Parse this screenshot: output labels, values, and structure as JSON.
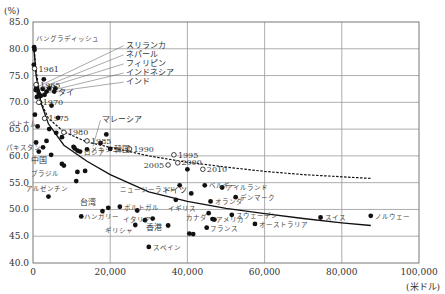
{
  "chart_data": {
    "type": "scatter",
    "title": "",
    "ylabel": "(%)",
    "xlabel": "(米ドル)",
    "xlim": [
      0,
      100000
    ],
    "ylim": [
      40,
      85
    ],
    "x_ticks": [
      0,
      20000,
      40000,
      60000,
      80000,
      100000
    ],
    "x_tick_labels": [
      "0",
      "20,000",
      "40,000",
      "60,000",
      "80,000",
      "100,000"
    ],
    "y_ticks": [
      40,
      45,
      50,
      55,
      60,
      65,
      70,
      75,
      80,
      85
    ],
    "y_tick_labels": [
      "40.0",
      "45.0",
      "50.0",
      "55.0",
      "60.0",
      "65.0",
      "70.0",
      "75.0",
      "80.0",
      "85.0"
    ],
    "grid": true,
    "series": [
      {
        "name": "countries",
        "marker": "filled-circle",
        "points": [
          {
            "x": 300,
            "y": 80.3,
            "label": "バングラディッシュ"
          },
          {
            "x": 400,
            "y": 79.8,
            "label": ""
          },
          {
            "x": 200,
            "y": 77.0,
            "label": ""
          },
          {
            "x": 900,
            "y": 72.8,
            "label": "スリランカ"
          },
          {
            "x": 700,
            "y": 72.3,
            "label": "ネパール"
          },
          {
            "x": 2500,
            "y": 72.5,
            "label": "フィリピン"
          },
          {
            "x": 3500,
            "y": 72.0,
            "label": "インドネシア"
          },
          {
            "x": 1500,
            "y": 71.6,
            "label": "インド"
          },
          {
            "x": 5500,
            "y": 72.0,
            "label": "タイ"
          },
          {
            "x": 2000,
            "y": 71.2,
            "label": ""
          },
          {
            "x": 4200,
            "y": 72.6,
            "label": ""
          },
          {
            "x": 1200,
            "y": 72.2,
            "label": ""
          },
          {
            "x": 5800,
            "y": 72.6,
            "label": ""
          },
          {
            "x": 3000,
            "y": 71.4,
            "label": ""
          },
          {
            "x": 1000,
            "y": 71.0,
            "label": ""
          },
          {
            "x": 2800,
            "y": 74.3,
            "label": ""
          },
          {
            "x": 1800,
            "y": 70.0,
            "label": ""
          },
          {
            "x": 4800,
            "y": 69.4,
            "label": ""
          },
          {
            "x": 6500,
            "y": 67.1,
            "label": ""
          },
          {
            "x": 500,
            "y": 67.7,
            "label": ""
          },
          {
            "x": 1200,
            "y": 65.5,
            "label": "ベトナム"
          },
          {
            "x": 4200,
            "y": 65.0,
            "label": ""
          },
          {
            "x": 800,
            "y": 62.5,
            "label": ""
          },
          {
            "x": 3500,
            "y": 62.8,
            "label": ""
          },
          {
            "x": 2600,
            "y": 61.6,
            "label": "パキスタン"
          },
          {
            "x": 6000,
            "y": 64.3,
            "label": ""
          },
          {
            "x": 7500,
            "y": 63.5,
            "label": ""
          },
          {
            "x": 1500,
            "y": 60.8,
            "label": ""
          },
          {
            "x": 4700,
            "y": 60.2,
            "label": "中国"
          },
          {
            "x": 10500,
            "y": 61.7,
            "label": ""
          },
          {
            "x": 10800,
            "y": 61.4,
            "label": ""
          },
          {
            "x": 11500,
            "y": 61.0,
            "label": ""
          },
          {
            "x": 12200,
            "y": 60.8,
            "label": "ロシア"
          },
          {
            "x": 14000,
            "y": 61.2,
            "label": "メキシコ"
          },
          {
            "x": 7500,
            "y": 58.5,
            "label": ""
          },
          {
            "x": 8000,
            "y": 58.2,
            "label": "ブラジル"
          },
          {
            "x": 11500,
            "y": 57.0,
            "label": ""
          },
          {
            "x": 13500,
            "y": 57.2,
            "label": ""
          },
          {
            "x": 11200,
            "y": 55.3,
            "label": "アルゼンチン"
          },
          {
            "x": 19000,
            "y": 64.0,
            "label": ""
          },
          {
            "x": 17500,
            "y": 62.4,
            "label": ""
          },
          {
            "x": 20000,
            "y": 61.3,
            "label": "韓国"
          },
          {
            "x": 4000,
            "y": 52.4,
            "label": ""
          },
          {
            "x": 12500,
            "y": 48.7,
            "label": "ハンガリー"
          },
          {
            "x": 18000,
            "y": 49.7,
            "label": "台湾"
          },
          {
            "x": 19500,
            "y": 50.3,
            "label": ""
          },
          {
            "x": 22500,
            "y": 50.5,
            "label": "ポルトガル"
          },
          {
            "x": 26500,
            "y": 47.1,
            "label": "ギリシャ"
          },
          {
            "x": 30000,
            "y": 43.0,
            "label": "スペイン"
          },
          {
            "x": 27000,
            "y": 49.8,
            "label": ""
          },
          {
            "x": 29000,
            "y": 48.0,
            "label": ""
          },
          {
            "x": 31000,
            "y": 48.3,
            "label": "イタリア"
          },
          {
            "x": 35000,
            "y": 47.0,
            "label": "香港"
          },
          {
            "x": 37000,
            "y": 51.8,
            "label": "イギリス"
          },
          {
            "x": 38000,
            "y": 54.5,
            "label": "ニュージーランド"
          },
          {
            "x": 41000,
            "y": 53.0,
            "label": "ドイツ"
          },
          {
            "x": 40000,
            "y": 57.5,
            "label": "2000"
          },
          {
            "x": 44500,
            "y": 54.5,
            "label": "ベルギー"
          },
          {
            "x": 49000,
            "y": 54.1,
            "label": "アイルランド"
          },
          {
            "x": 46000,
            "y": 51.5,
            "label": "オランダ"
          },
          {
            "x": 52500,
            "y": 52.3,
            "label": "デンマーク"
          },
          {
            "x": 45500,
            "y": 49.3,
            "label": "カナダ"
          },
          {
            "x": 46500,
            "y": 48.2,
            "label": "アメリカ"
          },
          {
            "x": 47000,
            "y": 48.1,
            "label": ""
          },
          {
            "x": 45000,
            "y": 46.6,
            "label": "フランス"
          },
          {
            "x": 40500,
            "y": 45.5,
            "label": ""
          },
          {
            "x": 41500,
            "y": 45.4,
            "label": ""
          },
          {
            "x": 51500,
            "y": 49.0,
            "label": "スウェーデン"
          },
          {
            "x": 57500,
            "y": 47.3,
            "label": "オーストラリア"
          },
          {
            "x": 74500,
            "y": 48.5,
            "label": "スイス"
          },
          {
            "x": 87500,
            "y": 48.8,
            "label": "ノルウェー"
          }
        ]
      },
      {
        "name": "year-trajectory",
        "marker": "open-circle",
        "points": [
          {
            "x": 400,
            "y": 76.3,
            "label": "1961"
          },
          {
            "x": 800,
            "y": 73.3,
            "label": "1965"
          },
          {
            "x": 1500,
            "y": 70.0,
            "label": "1970"
          },
          {
            "x": 3000,
            "y": 67.0,
            "label": "1975"
          },
          {
            "x": 8000,
            "y": 64.4,
            "label": "1980"
          },
          {
            "x": 14000,
            "y": 62.8,
            "label": "1985"
          },
          {
            "x": 25000,
            "y": 61.3,
            "label": "1990"
          },
          {
            "x": 36500,
            "y": 60.2,
            "label": "1995"
          },
          {
            "x": 35000,
            "y": 58.3,
            "label": "2005"
          },
          {
            "x": 37500,
            "y": 58.7,
            "label": ""
          },
          {
            "x": 44000,
            "y": 57.5,
            "label": "2010"
          }
        ]
      }
    ],
    "curves": [
      {
        "name": "trend-solid",
        "style": "solid",
        "points": [
          [
            200,
            80.5
          ],
          [
            800,
            75
          ],
          [
            2000,
            70
          ],
          [
            4000,
            66
          ],
          [
            8000,
            62
          ],
          [
            14000,
            59
          ],
          [
            20000,
            56.5
          ],
          [
            30000,
            53.3
          ],
          [
            40000,
            51.5
          ],
          [
            50000,
            50.2
          ],
          [
            60000,
            49.2
          ],
          [
            70000,
            48.3
          ],
          [
            80000,
            47.5
          ],
          [
            87500,
            47.0
          ]
        ]
      },
      {
        "name": "trend-dashed",
        "style": "dashed",
        "points": [
          [
            200,
            80.5
          ],
          [
            800,
            76
          ],
          [
            2000,
            70.2
          ],
          [
            4000,
            67
          ],
          [
            8000,
            64.5
          ],
          [
            14000,
            62.6
          ],
          [
            20000,
            61.6
          ],
          [
            30000,
            60.0
          ],
          [
            40000,
            58.8
          ],
          [
            50000,
            57.9
          ],
          [
            60000,
            57.1
          ],
          [
            70000,
            56.5
          ],
          [
            80000,
            56.1
          ],
          [
            87500,
            55.8
          ]
        ]
      }
    ],
    "callouts": [
      {
        "text": "スリランカ",
        "tx": 24000,
        "ty": 80.2,
        "from": [
          900,
          72.8
        ]
      },
      {
        "text": "ネパール",
        "tx": 24000,
        "ty": 78.5,
        "from": [
          700,
          72.3
        ]
      },
      {
        "text": "フィリピン",
        "tx": 24000,
        "ty": 76.8,
        "from": [
          2500,
          72.5
        ]
      },
      {
        "text": "インドネシア",
        "tx": 24000,
        "ty": 75.1,
        "from": [
          3500,
          72.0
        ]
      },
      {
        "text": "インド",
        "tx": 24000,
        "ty": 73.4,
        "from": [
          1500,
          71.6
        ]
      },
      {
        "text": "マレーシア",
        "tx": 18000,
        "ty": 66.3,
        "from": [
          15500,
          61.7
        ]
      }
    ],
    "legend": null
  }
}
